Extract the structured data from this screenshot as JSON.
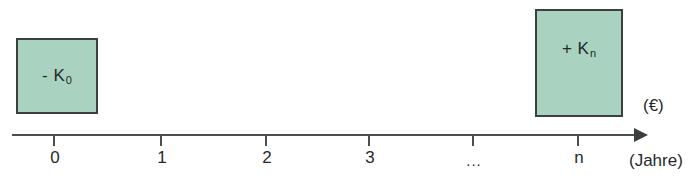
{
  "diagram": {
    "type": "cash-flow-timeline",
    "boxes": [
      {
        "id": "outflow",
        "label_prefix": "- K",
        "label_subscript": "0",
        "full_label": "- K0",
        "x": 16,
        "y": 38,
        "width": 82,
        "height": 76,
        "fill": "#a9d2c1",
        "border": "#3c413f",
        "at_tick": "0",
        "meaning": "initial investment outflow"
      },
      {
        "id": "inflow",
        "label_prefix": "+ K",
        "label_subscript": "n",
        "full_label": "+ Kn",
        "x": 535,
        "y": 9,
        "width": 88,
        "height": 108,
        "fill": "#a9d2c1",
        "border": "#3c413f",
        "at_tick": "n",
        "meaning": "final capital inflow"
      }
    ],
    "axis": {
      "line_color": "#4a4f4d",
      "start_x": 12,
      "end_x": 648,
      "y": 135,
      "arrow_direction": "right",
      "ticks": [
        {
          "label": "0",
          "x": 53
        },
        {
          "label": "1",
          "x": 160
        },
        {
          "label": "2",
          "x": 265
        },
        {
          "label": "3",
          "x": 368
        },
        {
          "label": "...",
          "x": 472
        },
        {
          "label": "n",
          "x": 577
        }
      ]
    },
    "annotations": {
      "currency_unit": "(€)",
      "time_unit": "(Jahre)"
    }
  }
}
